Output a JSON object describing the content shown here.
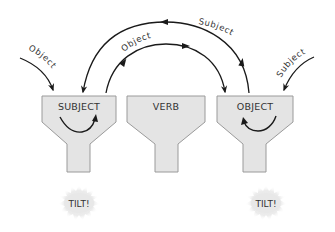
{
  "diagram": {
    "type": "process-flow",
    "funnels": [
      {
        "id": "subject",
        "label": "SUBJECT"
      },
      {
        "id": "verb",
        "label": "VERB"
      },
      {
        "id": "object",
        "label": "OBJECT"
      }
    ],
    "inputs": [
      {
        "label": "Object",
        "target": "subject"
      },
      {
        "label": "Subject",
        "target": "object"
      }
    ],
    "transfers": [
      {
        "label": "Object",
        "from": "subject",
        "to": "object",
        "path": "inner-arc"
      },
      {
        "label": "Subject",
        "from": "object",
        "to": "subject",
        "path": "outer-arc"
      }
    ],
    "outcomes": [
      {
        "label": "TILT!",
        "under": "subject"
      },
      {
        "label": "TILT!",
        "under": "object"
      }
    ],
    "colors": {
      "funnel_fill": "#e4e4e4",
      "funnel_stroke": "#9a9a9a",
      "arrow": "#1a1a1a",
      "text": "#333333",
      "burst": "#e6e6e6"
    }
  }
}
